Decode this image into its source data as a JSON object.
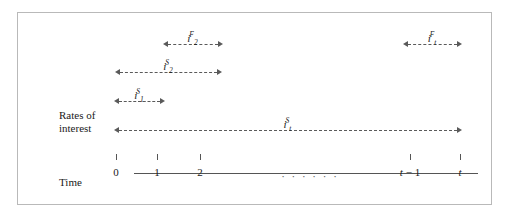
{
  "figure": {
    "axis_labels": {
      "rates": "Rates of\ninterest",
      "time": "Time"
    },
    "ellipsis": "· · · · · ·",
    "ticks": [
      {
        "label": "0",
        "x": 116
      },
      {
        "label": "1",
        "x": 157
      },
      {
        "label": "2",
        "x": 200
      },
      {
        "label": "t − 1",
        "x": 410
      },
      {
        "label": "t",
        "x": 460
      }
    ],
    "arrows": [
      {
        "name": "arrow-i2F",
        "base": "i",
        "sub": "2",
        "sup": "F",
        "left": 163,
        "right": 223,
        "top": 38
      },
      {
        "name": "arrow-itF",
        "base": "i",
        "sub": "t",
        "sup": "F",
        "left": 403,
        "right": 462,
        "top": 38
      },
      {
        "name": "arrow-i2S",
        "base": "i",
        "sub": "2",
        "sup": "S",
        "left": 115,
        "right": 222,
        "top": 66
      },
      {
        "name": "arrow-i1S",
        "base": "i",
        "sub": "1",
        "sup": "S",
        "left": 114,
        "right": 165,
        "top": 95
      },
      {
        "name": "arrow-itS",
        "base": "i",
        "sub": "t",
        "sup": "S",
        "left": 114,
        "right": 462,
        "top": 124
      }
    ],
    "colors": {
      "frame": "#b9b9b9",
      "arrow": "#5a5a5a",
      "axis": "#555555",
      "text": "#1a1a1a",
      "background": "#ffffff"
    }
  }
}
